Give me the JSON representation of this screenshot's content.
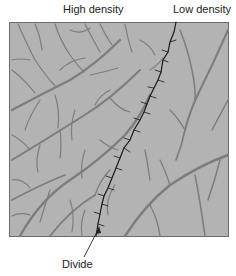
{
  "figure": {
    "type": "drainage-density-diagram",
    "labels": {
      "high_density": "High density",
      "low_density": "Low density",
      "divide": "Divide"
    },
    "colors": {
      "background": "#ffffff",
      "panel_fill": "#b3b3b3",
      "panel_border": "#6a6a6a",
      "channel": "#7d7d7d",
      "divide_line": "#1a1a1a",
      "text": "#222222"
    }
  }
}
